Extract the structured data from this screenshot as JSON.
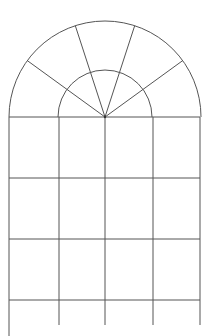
{
  "diagram": {
    "title": "",
    "stroke_color": "#555555",
    "background": "#ffffff",
    "center": [
      105,
      117
    ],
    "outer_radius": 96,
    "inner_radius": 47,
    "verticals_x": [
      9,
      59,
      105,
      153,
      200
    ],
    "horizontals_y": [
      117,
      178,
      239,
      300
    ],
    "radial_angles_deg": [
      144,
      108,
      72,
      36
    ],
    "bottom_y": 325
  }
}
